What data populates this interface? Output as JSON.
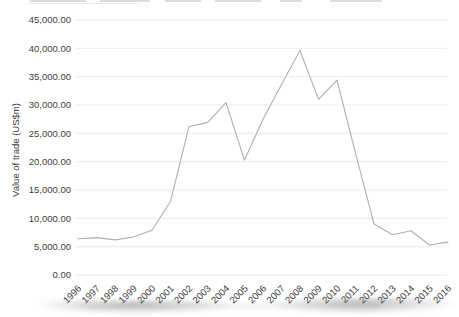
{
  "chart_data": {
    "type": "line",
    "title": "",
    "xlabel": "",
    "ylabel": "Value of trade (US$m)",
    "categories": [
      "1996",
      "1997",
      "1998",
      "1999",
      "2000",
      "2001",
      "2002",
      "2003",
      "2004",
      "2005",
      "2006",
      "2007",
      "2008",
      "2009",
      "2010",
      "2011",
      "2012",
      "2013",
      "2014",
      "2015",
      "2016"
    ],
    "series": [
      {
        "name": "Value of trade (US$m)",
        "values": [
          6400,
          6600,
          6200,
          6700,
          7900,
          13000,
          26200,
          26900,
          30400,
          20300,
          27500,
          33600,
          39600,
          31000,
          34400,
          21500,
          9000,
          7100,
          7800,
          5300,
          5800
        ]
      }
    ],
    "ylim": [
      0,
      45000
    ],
    "ytick_step": 5000,
    "ytick_labels": [
      "0.00",
      "5,000.00",
      "10,000.00",
      "15,000.00",
      "20,000.00",
      "25,000.00",
      "30,000.00",
      "35,000.00",
      "40,000.00",
      "45,000.00"
    ],
    "grid": "horizontal",
    "legend_position": "none",
    "line_color": "#b0b0b0",
    "grid_color": "#ebebeb",
    "text_color": "#3d3d3d",
    "background": "#ffffff"
  }
}
